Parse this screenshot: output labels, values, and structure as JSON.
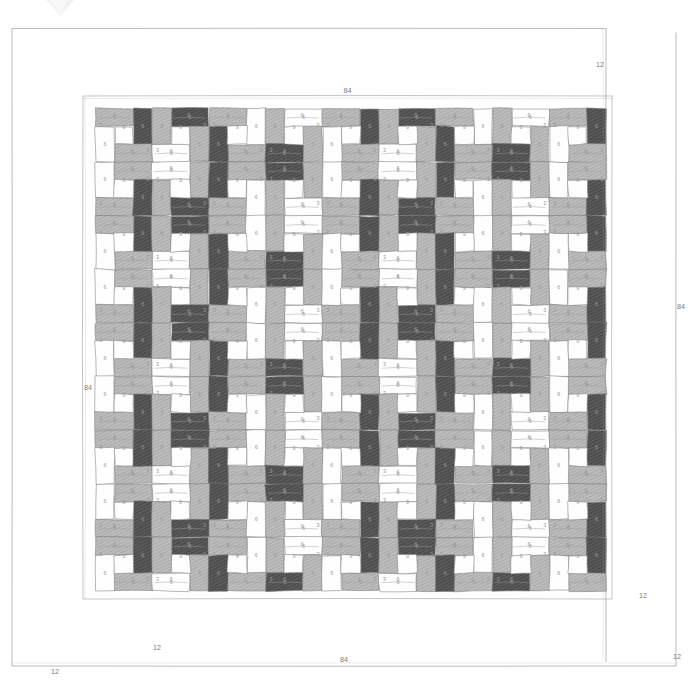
{
  "document": {
    "type": "quilt-pattern-diagram",
    "title": "Quilt Layout Diagram",
    "watermark": "gem-watermark"
  },
  "overall_dimensions": {
    "top_label": "84",
    "bottom_label": "84",
    "left_label": "84",
    "right_label": "84",
    "units": "inches"
  },
  "border": {
    "width_label": "12",
    "corner_labels": [
      "12",
      "12",
      "12",
      "12"
    ]
  },
  "block": {
    "finished_size_label": "9",
    "strip_long_label": "6",
    "strip_short_label": "3",
    "center_label": "3"
  },
  "fabrics": {
    "dark": "#575757",
    "medium": "#b3b3b3",
    "light": "#ffffff",
    "line": "#6e6e6e",
    "hatch_dark": "#3f3f3f",
    "hatch_medium": "#9d9d9d"
  },
  "grid": {
    "columns": 9,
    "rows": 9,
    "block_inches": 9,
    "interior_inches": 60
  },
  "chart_data": {
    "type": "diagram",
    "xlabel": "84",
    "ylabel": "84",
    "annotations": [
      "84",
      "84",
      "84",
      "84",
      "12",
      "12",
      "12",
      "12"
    ],
    "repeat_unit": {
      "name": "pinwheel-block",
      "size": 9,
      "pieces": [
        {
          "label": "6",
          "w": 6,
          "h": 3
        },
        {
          "label": "6",
          "w": 3,
          "h": 6
        },
        {
          "label": "6",
          "w": 6,
          "h": 3
        },
        {
          "label": "6",
          "w": 3,
          "h": 6
        },
        {
          "label": "3",
          "w": 3,
          "h": 3
        }
      ]
    }
  }
}
